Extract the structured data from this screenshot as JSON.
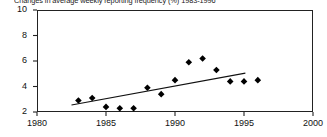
{
  "chart_data": {
    "type": "scatter",
    "title": "Changes in average weekly reporting frequency (%) 1983-1996",
    "xlabel": "",
    "ylabel": "",
    "xlim": [
      1980,
      2000
    ],
    "ylim": [
      2,
      10
    ],
    "xticks": [
      "1980",
      "1985",
      "1990",
      "1995",
      "2000"
    ],
    "yticks": [
      "2",
      "4",
      "6",
      "8",
      "10"
    ],
    "grid": false,
    "legend": "none",
    "marker": "filled-diamond",
    "x": [
      1983,
      1984,
      1985,
      1986,
      1987,
      1988,
      1989,
      1990,
      1991,
      1992,
      1993,
      1994,
      1995,
      1996
    ],
    "values": [
      2.9,
      3.1,
      2.4,
      2.3,
      2.3,
      3.9,
      3.4,
      4.5,
      5.9,
      6.2,
      5.3,
      4.4,
      4.4,
      4.5
    ],
    "series": [
      {
        "name": "Average weekly reporting frequency",
        "values": [
          2.9,
          3.1,
          2.4,
          2.3,
          2.3,
          3.9,
          3.4,
          4.5,
          5.9,
          6.2,
          5.3,
          4.4,
          4.4,
          4.5
        ]
      }
    ],
    "trendline": {
      "name": "linear fit",
      "x_start": 1982.5,
      "y_start": 2.55,
      "x_end": 1995.1,
      "y_end": 5.05
    },
    "colors": {
      "marker": "#000000",
      "axis": "#222222",
      "trendline": "#111111",
      "background": "#ffffff"
    }
  }
}
